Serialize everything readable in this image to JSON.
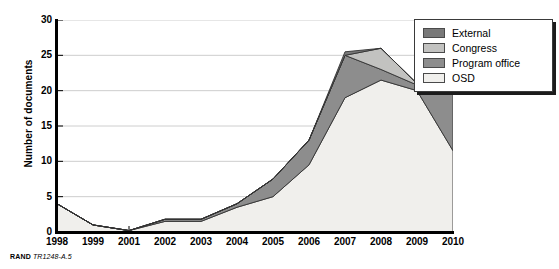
{
  "chart_data": {
    "type": "area",
    "stacked": true,
    "title": "",
    "xlabel": "",
    "ylabel": "Number of documents",
    "categories": [
      "1998",
      "1999",
      "2001",
      "2002",
      "2003",
      "2004",
      "2005",
      "2006",
      "2007",
      "2008",
      "2009",
      "2010"
    ],
    "ylim": [
      0,
      30
    ],
    "yticks": [
      0,
      5,
      10,
      15,
      20,
      25,
      30
    ],
    "grid": true,
    "legend_position": "top-right",
    "series": [
      {
        "name": "OSD",
        "color": "#f0efec",
        "values": [
          4,
          1,
          0.2,
          1.5,
          1.5,
          3.5,
          5,
          9.5,
          19,
          21.5,
          20,
          11.5
        ]
      },
      {
        "name": "Program office",
        "color": "#8d8d8d",
        "values": [
          0,
          0,
          0,
          0.3,
          0.3,
          0.5,
          2.5,
          3.5,
          6,
          1.5,
          0.8,
          9.5
        ]
      },
      {
        "name": "Congress",
        "color": "#c2c2c0",
        "values": [
          0,
          0,
          0,
          0,
          0,
          0,
          0,
          0,
          0,
          3,
          0.2,
          0
        ]
      },
      {
        "name": "External",
        "color": "#797979",
        "values": [
          0,
          0,
          0,
          0,
          0,
          0,
          0,
          0,
          0.5,
          0,
          0,
          0
        ]
      }
    ],
    "legend_entries": [
      {
        "label": "External",
        "color": "#797979"
      },
      {
        "label": "Congress",
        "color": "#c2c2c0"
      },
      {
        "label": "Program office",
        "color": "#8d8d8d"
      },
      {
        "label": "OSD",
        "color": "#f0efec"
      }
    ]
  },
  "caption": {
    "publisher": "RAND",
    "code": "TR1248-A.5"
  }
}
